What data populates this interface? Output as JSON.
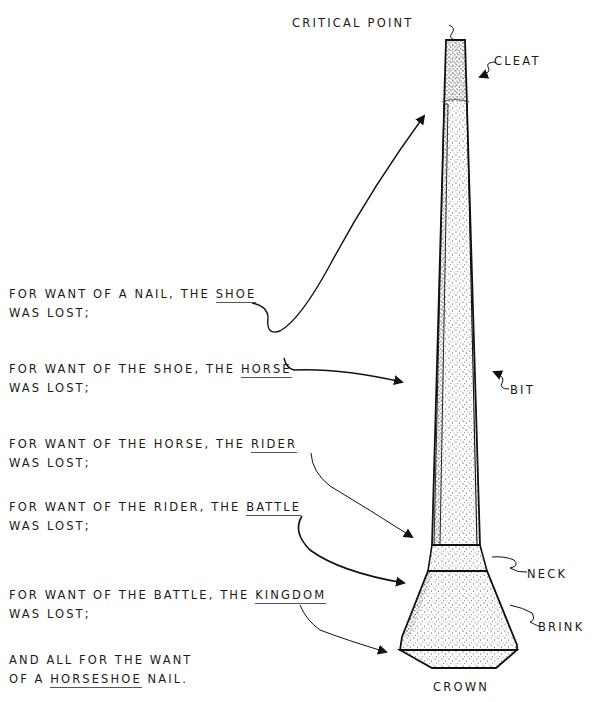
{
  "labels": {
    "critical_point": "CRITICAL POINT",
    "cleat": "CLEAT",
    "bit": "BIT",
    "neck": "NECK",
    "brink": "BRINK",
    "crown": "CROWN"
  },
  "stanzas": [
    {
      "line1_prefix": "FOR WANT OF A NAIL, THE ",
      "key": "SHOE",
      "line2": "WAS LOST;"
    },
    {
      "line1_prefix": "FOR WANT OF THE SHOE, THE ",
      "key": "HORSE",
      "line2": "WAS LOST;"
    },
    {
      "line1_prefix": "FOR WANT OF THE HORSE, THE ",
      "key": "RIDER",
      "line2": "WAS LOST;"
    },
    {
      "line1_prefix": "FOR WANT OF THE RIDER, THE ",
      "key": "BATTLE",
      "line2": "WAS LOST;"
    },
    {
      "line1_prefix": "FOR WANT OF THE BATTLE, THE ",
      "key": "KINGDOM",
      "line2": "WAS LOST;"
    }
  ],
  "closing": {
    "line1": "AND ALL FOR THE WANT",
    "line2_prefix": "OF A ",
    "key": "HORSESHOE",
    "line2_suffix": " NAIL."
  }
}
